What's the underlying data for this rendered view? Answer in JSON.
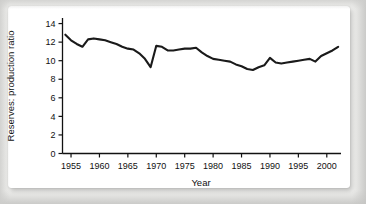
{
  "chart_data": {
    "type": "line",
    "title": "",
    "xlabel": "Year",
    "ylabel": "Reserves: production ratio",
    "xlim": [
      1953.5,
      2002.5
    ],
    "ylim": [
      0,
      14.6
    ],
    "grid": false,
    "legend": null,
    "xticks": [
      1955,
      1960,
      1965,
      1970,
      1975,
      1980,
      1985,
      1990,
      1995,
      2000
    ],
    "xtick_labels": [
      "1955",
      "1960",
      "1965",
      "1970",
      "1975",
      "1980",
      "1985",
      "1990",
      "1995",
      "2000"
    ],
    "yticks": [
      0,
      2,
      4,
      6,
      8,
      10,
      12,
      14
    ],
    "ytick_labels": [
      "0",
      "2",
      "4",
      "6",
      "8",
      "10",
      "12",
      "14"
    ],
    "series": [
      {
        "name": "Reserves: production ratio",
        "color": "#1a1a1a",
        "x": [
          1954,
          1955,
          1956,
          1957,
          1958,
          1959,
          1960,
          1961,
          1962,
          1963,
          1964,
          1965,
          1966,
          1967,
          1968,
          1969,
          1970,
          1971,
          1972,
          1973,
          1974,
          1975,
          1976,
          1977,
          1978,
          1979,
          1980,
          1981,
          1982,
          1983,
          1984,
          1985,
          1986,
          1987,
          1988,
          1989,
          1990,
          1991,
          1992,
          1993,
          1994,
          1995,
          1996,
          1997,
          1998,
          1999,
          2000,
          2001,
          2002
        ],
        "values": [
          12.8,
          12.2,
          11.8,
          11.5,
          12.3,
          12.4,
          12.3,
          12.2,
          12.0,
          11.8,
          11.5,
          11.3,
          11.2,
          10.8,
          10.2,
          9.3,
          11.6,
          11.5,
          11.1,
          11.1,
          11.2,
          11.3,
          11.3,
          11.4,
          10.9,
          10.5,
          10.2,
          10.1,
          10.0,
          9.9,
          9.6,
          9.4,
          9.1,
          9.0,
          9.3,
          9.5,
          10.3,
          9.8,
          9.7,
          9.8,
          9.9,
          10.0,
          10.1,
          10.2,
          9.9,
          10.5,
          10.8,
          11.1,
          11.5
        ]
      }
    ]
  }
}
